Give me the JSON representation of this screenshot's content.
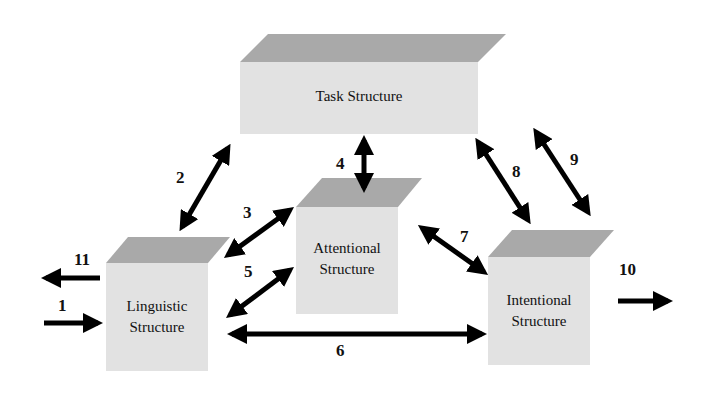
{
  "diagram": {
    "boxes": {
      "task": {
        "label": "Task Structure"
      },
      "attentional": {
        "line1": "Attentional",
        "line2": "Structure"
      },
      "linguistic": {
        "line1": "Linguistic",
        "line2": "Structure"
      },
      "intentional": {
        "line1": "Intentional",
        "line2": "Structure"
      }
    },
    "arrows": [
      {
        "id": "1",
        "label": "1",
        "from": "input",
        "to": "Linguistic Structure",
        "direction": "one-way"
      },
      {
        "id": "2",
        "label": "2",
        "from": "Linguistic Structure",
        "to": "Task Structure",
        "direction": "two-way"
      },
      {
        "id": "3",
        "label": "3",
        "from": "Linguistic Structure",
        "to": "Attentional Structure",
        "direction": "two-way"
      },
      {
        "id": "4",
        "label": "4",
        "from": "Task Structure",
        "to": "Attentional Structure",
        "direction": "two-way"
      },
      {
        "id": "5",
        "label": "5",
        "from": "Linguistic Structure",
        "to": "Attentional Structure",
        "direction": "two-way"
      },
      {
        "id": "6",
        "label": "6",
        "from": "Linguistic Structure",
        "to": "Intentional Structure",
        "direction": "two-way"
      },
      {
        "id": "7",
        "label": "7",
        "from": "Attentional Structure",
        "to": "Intentional Structure",
        "direction": "two-way"
      },
      {
        "id": "8",
        "label": "8",
        "from": "Task Structure",
        "to": "Intentional Structure",
        "direction": "two-way"
      },
      {
        "id": "9",
        "label": "9",
        "from": "Task Structure",
        "to": "Intentional Structure",
        "direction": "two-way"
      },
      {
        "id": "10",
        "label": "10",
        "from": "Intentional Structure",
        "to": "output",
        "direction": "one-way"
      },
      {
        "id": "11",
        "label": "11",
        "from": "Linguistic Structure",
        "to": "output",
        "direction": "one-way"
      }
    ],
    "colors": {
      "box_front": "#e2e2e2",
      "box_top": "#a9a9a9",
      "arrow": "#000000"
    }
  }
}
